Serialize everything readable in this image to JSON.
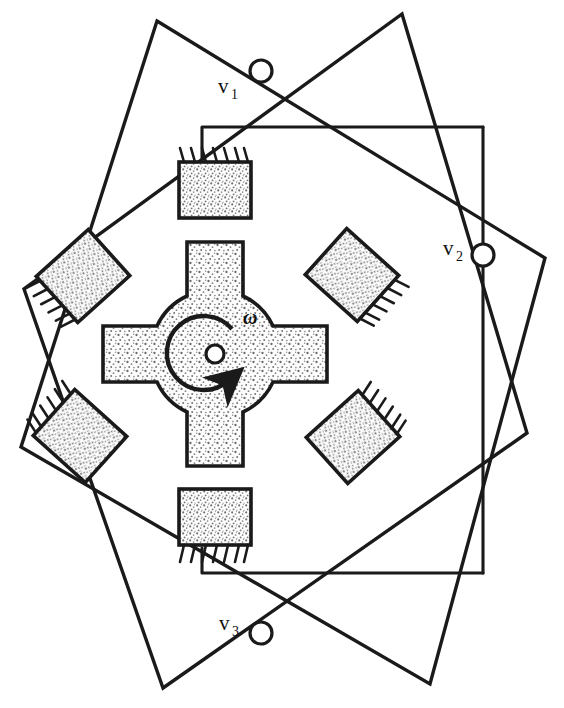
{
  "figure": {
    "background_color": "#ffffff",
    "line_color": "#1a1a1a",
    "fill_color": "#d8d8d8"
  },
  "terminals": [
    {
      "id": "v1",
      "label": "v",
      "subscript": "1",
      "cx": 261,
      "cy": 71,
      "r": 11,
      "label_x": 218,
      "label_y": 93,
      "sub_x": 231,
      "sub_y": 99
    },
    {
      "id": "v2",
      "label": "v",
      "subscript": "2",
      "cx": 483,
      "cy": 255,
      "r": 11,
      "label_x": 443,
      "label_y": 255,
      "sub_x": 456,
      "sub_y": 261
    },
    {
      "id": "v3",
      "label": "v",
      "subscript": "3",
      "cx": 261,
      "cy": 633,
      "r": 11,
      "label_x": 219,
      "label_y": 630,
      "sub_x": 232,
      "sub_y": 636
    }
  ],
  "rotor": {
    "name": "four-pole-cross-rotor",
    "center_x": 215,
    "center_y": 354,
    "hub_radius": 62,
    "pole_width": 56,
    "pole_reach": 112,
    "axle_radius": 9,
    "rotation_symbol": "ω",
    "rotation_label_x": 243,
    "rotation_label_y": 324,
    "rotation_direction": "clockwise"
  },
  "stator_coils": [
    {
      "id": "coil-top",
      "name": "stator-coil-top",
      "cx": 215,
      "cy": 190,
      "w": 72,
      "h": 56,
      "angle": 0,
      "teeth_edge": "top"
    },
    {
      "id": "coil-upper-left",
      "name": "stator-coil-upper-left",
      "cx": 83,
      "cy": 276,
      "w": 70,
      "h": 62,
      "angle": -42,
      "teeth_edge": "left"
    },
    {
      "id": "coil-upper-right",
      "name": "stator-coil-upper-right",
      "cx": 352,
      "cy": 275,
      "w": 70,
      "h": 62,
      "angle": 42,
      "teeth_edge": "right"
    },
    {
      "id": "coil-lower-left",
      "name": "stator-coil-lower-left",
      "cx": 80,
      "cy": 436,
      "w": 70,
      "h": 62,
      "angle": 42,
      "teeth_edge": "left"
    },
    {
      "id": "coil-lower-right",
      "name": "stator-coil-lower-right",
      "cx": 353,
      "cy": 437,
      "w": 70,
      "h": 62,
      "angle": -42,
      "teeth_edge": "right"
    },
    {
      "id": "coil-bottom",
      "name": "stator-coil-bottom",
      "cx": 215,
      "cy": 517,
      "w": 72,
      "h": 56,
      "angle": 0,
      "teeth_edge": "bottom"
    }
  ],
  "circuit_wires": {
    "top_lead": "from top coil up to y=127 then right to x=483",
    "right_rail": "vertical at x=483 from y=127 to y=573",
    "bottom_lead": "from bottom coil down to y=573 then right to x=483"
  },
  "tilted_square": {
    "name": "rotating-winding-outline",
    "corners": [
      {
        "x": 157,
        "y": 21
      },
      {
        "x": 545,
        "y": 258
      },
      {
        "x": 430,
        "y": 684
      },
      {
        "x": 21,
        "y": 447
      }
    ]
  },
  "inner_tilted_square": {
    "name": "secondary-winding-outline",
    "corners": [
      {
        "x": 163,
        "y": 688
      },
      {
        "x": 527,
        "y": 433
      },
      {
        "x": 402,
        "y": 14
      },
      {
        "x": 24,
        "y": 289
      }
    ]
  }
}
